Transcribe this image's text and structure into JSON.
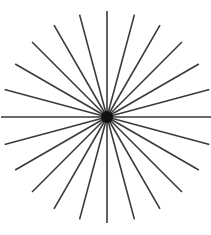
{
  "figure": {
    "type": "radial-line-burst",
    "canvas": {
      "width": 211,
      "height": 235,
      "background_color": "#ffffff"
    },
    "center": {
      "x": 107,
      "y": 117,
      "hub_radius": 6,
      "hub_color": "#111111",
      "label": "convergence-point"
    },
    "rays": {
      "count": 24,
      "angle_step_degrees": 15,
      "start_angle_degrees": 0,
      "radius": 106,
      "stroke_color": "#3a3a3a",
      "stroke_width": 1.6,
      "inner_gap": 0,
      "description": "24 evenly spaced straight lines radiating from a single central point at 15 degree intervals"
    },
    "edge_ray_counts": {
      "top": 5,
      "bottom": 5,
      "left": 7,
      "right": 7
    },
    "axes": {
      "horizontal_present": true,
      "horizontal_y": 117,
      "horizontal_x_start": 5,
      "horizontal_x_end": 203,
      "vertical_present": true,
      "vertical_x": 107,
      "vertical_y_start": 10,
      "vertical_y_end": 225
    }
  },
  "chart_data": {
    "type": "line",
    "xlabel": "",
    "ylabel": "",
    "categories": [
      "0",
      "15",
      "30",
      "45",
      "60",
      "75",
      "90",
      "105",
      "120",
      "135",
      "150",
      "165",
      "180",
      "195",
      "210",
      "225",
      "240",
      "255",
      "270",
      "285",
      "300",
      "315",
      "330",
      "345"
    ],
    "values": [
      106,
      106,
      106,
      106,
      106,
      106,
      106,
      106,
      106,
      106,
      106,
      106,
      106,
      106,
      106,
      106,
      106,
      106,
      106,
      106,
      106,
      106,
      106,
      106
    ],
    "series": [
      {
        "name": "ray-length-by-angle",
        "values": [
          106,
          106,
          106,
          106,
          106,
          106,
          106,
          106,
          106,
          106,
          106,
          106,
          106,
          106,
          106,
          106,
          106,
          106,
          106,
          106,
          106,
          106,
          106,
          106
        ]
      }
    ]
  }
}
